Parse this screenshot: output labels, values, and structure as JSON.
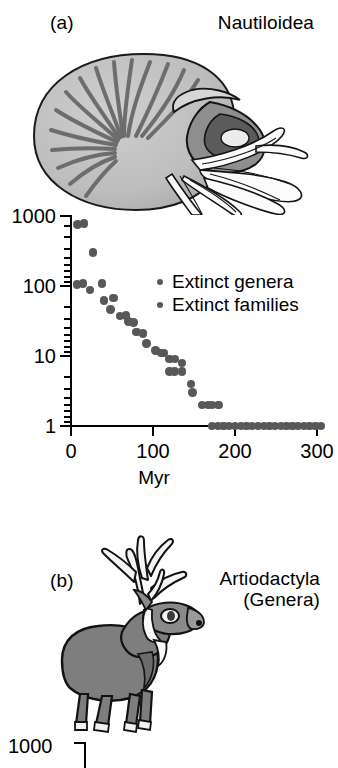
{
  "figure": {
    "panel_a": {
      "letter": "(a)",
      "taxon": "Nautiloidea",
      "illustration": "nautilus-illustration"
    },
    "panel_b": {
      "letter": "(b)",
      "taxon": "Artiodactyla\n(Genera)",
      "illustration": "deer-illustration"
    },
    "bottom_partial": {
      "y_top_label": "1000"
    }
  },
  "chart_data": {
    "type": "scatter",
    "title": "Nautiloidea",
    "xlabel": "Myr",
    "ylabel": "",
    "xlim": [
      0,
      315
    ],
    "ylim": [
      1,
      1000
    ],
    "yscale": "log",
    "xticks": [
      0,
      100,
      200,
      300
    ],
    "xticklabels": [
      "0",
      "100",
      "200",
      "300"
    ],
    "yticks": [
      1,
      10,
      100,
      1000
    ],
    "yticklabels": [
      "1",
      "10",
      "100",
      "1000"
    ],
    "grid": false,
    "legend_position": "upper-right-inside",
    "marker_color": "#585858",
    "series": [
      {
        "name": "Extinct genera",
        "points": [
          [
            8,
            760
          ],
          [
            16,
            780
          ],
          [
            27,
            300
          ],
          [
            7,
            105
          ],
          [
            15,
            108
          ],
          [
            23,
            88
          ],
          [
            38,
            108
          ],
          [
            40,
            62
          ],
          [
            48,
            46
          ],
          [
            52,
            68
          ],
          [
            60,
            37
          ],
          [
            67,
            38
          ],
          [
            70,
            31
          ],
          [
            76,
            30
          ],
          [
            80,
            22
          ],
          [
            88,
            21
          ],
          [
            92,
            15
          ],
          [
            103,
            12
          ],
          [
            110,
            11
          ],
          [
            113,
            11
          ],
          [
            120,
            9
          ],
          [
            127,
            9
          ],
          [
            120,
            6
          ],
          [
            126,
            6
          ],
          [
            135,
            8
          ],
          [
            135,
            6
          ],
          [
            146,
            4
          ],
          [
            148,
            3
          ],
          [
            160,
            2
          ],
          [
            167,
            2
          ],
          [
            172,
            2
          ],
          [
            180,
            2
          ],
          [
            172,
            1
          ],
          [
            179,
            1
          ],
          [
            186,
            1
          ],
          [
            193,
            1
          ],
          [
            200,
            1
          ],
          [
            207,
            1
          ],
          [
            214,
            1
          ],
          [
            221,
            1
          ],
          [
            228,
            1
          ],
          [
            235,
            1
          ],
          [
            242,
            1
          ],
          [
            249,
            1
          ],
          [
            256,
            1
          ],
          [
            263,
            1
          ],
          [
            270,
            1
          ],
          [
            277,
            1
          ],
          [
            284,
            1
          ],
          [
            291,
            1
          ],
          [
            298,
            1
          ],
          [
            305,
            1
          ]
        ]
      },
      {
        "name": "Extinct families",
        "points": []
      }
    ],
    "legend": [
      {
        "label": "Extinct genera"
      },
      {
        "label": "Extinct families"
      }
    ]
  }
}
